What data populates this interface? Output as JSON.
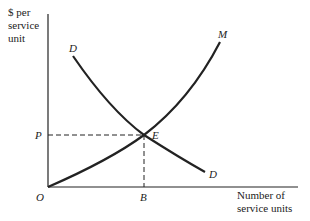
{
  "diagram": {
    "y_axis_label": [
      "$ per",
      "service",
      "unit"
    ],
    "x_axis_label": [
      "Number of",
      "service units"
    ],
    "curves": [
      {
        "name": "D",
        "label_start": "D",
        "label_end": "D",
        "kind": "demand (downward sloping)"
      },
      {
        "name": "M",
        "label_end": "M",
        "kind": "marginal cost (upward sloping from origin)"
      }
    ],
    "points": {
      "origin": "O",
      "equilibrium": "E",
      "price": "P",
      "quantity": "B"
    },
    "colors": {
      "line": "#222222",
      "background": "#ffffff"
    }
  }
}
